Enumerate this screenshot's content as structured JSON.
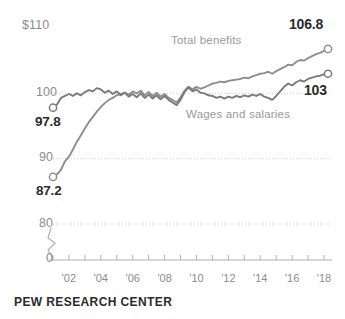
{
  "footer": {
    "credit": "PEW RESEARCH CENTER"
  },
  "axis": {
    "y_top_label": "$110",
    "y_labels": [
      "$110",
      "100",
      "90",
      "80",
      "0"
    ],
    "x_labels": [
      "'02",
      "'04",
      "'06",
      "'08",
      "'10",
      "'12",
      "'14",
      "'16",
      "'18"
    ],
    "break_marker": "axis-break"
  },
  "annotations": {
    "benefits_series_label": "Total benefits",
    "wages_series_label": "Wages and salaries",
    "benefits_end_value": "106.8",
    "wages_end_value": "103",
    "wages_start_value": "97.8",
    "benefits_start_value": "87.2"
  },
  "colors": {
    "benefits_line": "#8e8e8e",
    "wages_line": "#7a7a7a",
    "gridline": "#cfcfcf",
    "axis": "#b0b0b0",
    "label_gray": "#8c8c8c",
    "value_dark": "#2b2b2b"
  },
  "chart_data": {
    "type": "line",
    "title": "",
    "subtitle": "",
    "xlabel": "",
    "ylabel": "",
    "ylim": [
      80,
      110
    ],
    "y_axis_break": [
      0,
      80
    ],
    "yticks": [
      80,
      90,
      100,
      110
    ],
    "grid": true,
    "legend": "inline-labels",
    "xlim": [
      2001.0,
      2018.5
    ],
    "xticks": [
      2002,
      2004,
      2006,
      2008,
      2010,
      2012,
      2014,
      2016,
      2018
    ],
    "x": [
      2001.0,
      2001.25,
      2001.5,
      2001.75,
      2002.0,
      2002.25,
      2002.5,
      2002.75,
      2003.0,
      2003.25,
      2003.5,
      2003.75,
      2004.0,
      2004.25,
      2004.5,
      2004.75,
      2005.0,
      2005.25,
      2005.5,
      2005.75,
      2006.0,
      2006.25,
      2006.5,
      2006.75,
      2007.0,
      2007.25,
      2007.5,
      2007.75,
      2008.0,
      2008.25,
      2008.5,
      2008.75,
      2009.0,
      2009.25,
      2009.5,
      2009.75,
      2010.0,
      2010.25,
      2010.5,
      2010.75,
      2011.0,
      2011.25,
      2011.5,
      2011.75,
      2012.0,
      2012.25,
      2012.5,
      2012.75,
      2013.0,
      2013.25,
      2013.5,
      2013.75,
      2014.0,
      2014.25,
      2014.5,
      2014.75,
      2015.0,
      2015.25,
      2015.5,
      2015.75,
      2016.0,
      2016.25,
      2016.5,
      2016.75,
      2017.0,
      2017.25,
      2017.5,
      2017.75,
      2018.0,
      2018.25
    ],
    "series": [
      {
        "name": "Total benefits",
        "color": "#8e8e8e",
        "start_value": 87.2,
        "end_value": 106.8,
        "marker_start": "open-circle",
        "marker_end": "open-circle",
        "values": [
          87.2,
          87.6,
          88.3,
          89.6,
          90.3,
          91.4,
          92.6,
          93.6,
          94.6,
          95.6,
          96.4,
          97.2,
          97.9,
          98.5,
          99.0,
          99.3,
          99.7,
          99.9,
          100.1,
          99.8,
          100.3,
          100.0,
          100.4,
          99.7,
          100.2,
          99.6,
          100.1,
          99.5,
          99.9,
          99.3,
          99.0,
          98.6,
          99.4,
          100.4,
          101.0,
          100.6,
          101.0,
          100.7,
          100.9,
          101.2,
          101.5,
          101.6,
          101.8,
          101.7,
          101.9,
          102.0,
          102.1,
          102.2,
          102.4,
          102.3,
          102.6,
          102.8,
          103.0,
          103.1,
          103.3,
          103.0,
          103.4,
          103.7,
          104.0,
          104.4,
          104.3,
          104.8,
          105.1,
          105.0,
          105.4,
          105.7,
          106.0,
          106.2,
          106.5,
          106.8
        ]
      },
      {
        "name": "Wages and salaries",
        "color": "#7a7a7a",
        "start_value": 97.8,
        "end_value": 103.0,
        "marker_start": "open-circle",
        "marker_end": "open-circle",
        "values": [
          97.8,
          98.3,
          99.3,
          99.6,
          99.9,
          99.6,
          100.0,
          99.7,
          100.2,
          100.5,
          100.3,
          100.8,
          100.6,
          100.1,
          100.4,
          99.9,
          100.3,
          99.7,
          100.1,
          99.5,
          99.9,
          99.4,
          100.0,
          99.3,
          99.8,
          99.2,
          99.7,
          99.1,
          99.6,
          99.0,
          98.6,
          98.2,
          99.0,
          100.2,
          100.9,
          100.3,
          100.6,
          100.1,
          100.0,
          99.7,
          99.6,
          99.3,
          99.5,
          99.2,
          99.5,
          99.3,
          99.6,
          99.4,
          99.7,
          99.5,
          99.8,
          99.6,
          99.9,
          99.5,
          99.3,
          99.0,
          99.6,
          100.3,
          101.0,
          101.5,
          101.2,
          101.7,
          102.0,
          101.8,
          102.2,
          102.4,
          102.6,
          102.7,
          102.9,
          103.0
        ]
      }
    ]
  }
}
